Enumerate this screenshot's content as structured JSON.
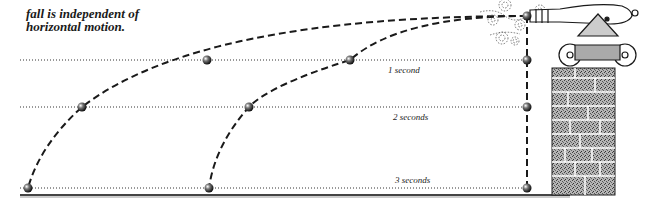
{
  "caption": {
    "line0": "Vertical motion of free",
    "line1": "fall is independent of",
    "line2": "horizontal motion."
  },
  "time_labels": [
    {
      "label": "1 second",
      "y": 60
    },
    {
      "label": "2 seconds",
      "y": 107
    },
    {
      "label": "3 seconds",
      "y": 188
    }
  ],
  "trajectories": [
    {
      "name": "fast-projectile",
      "points": [
        [
          527,
          16
        ],
        [
          350,
          60
        ],
        [
          82,
          107
        ],
        [
          28,
          188
        ]
      ]
    },
    {
      "name": "slow-projectile",
      "points": [
        [
          527,
          16
        ],
        [
          207,
          60
        ]
      ]
    },
    {
      "name": "second-projectile",
      "points": [
        [
          350,
          60
        ],
        [
          249,
          107
        ],
        [
          209,
          188
        ]
      ]
    },
    {
      "name": "dropped-ball",
      "points": [
        [
          527,
          16
        ],
        [
          527,
          60
        ],
        [
          527,
          107
        ],
        [
          527,
          188
        ]
      ]
    }
  ],
  "colors": {
    "ink": "#1a1a1a",
    "ground": "#555555",
    "stone": "#8a8a8a"
  }
}
